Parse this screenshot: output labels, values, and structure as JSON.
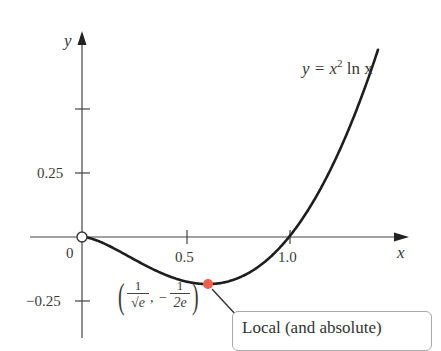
{
  "chart_data": {
    "type": "line",
    "title": "",
    "function_label": "y = x² ln x",
    "xlabel": "x",
    "ylabel": "y",
    "x_ticks": [
      {
        "value": 0,
        "label": "0"
      },
      {
        "value": 0.5,
        "label": "0.5"
      },
      {
        "value": 1.0,
        "label": "1.0"
      }
    ],
    "y_ticks": [
      {
        "value": 0.5,
        "label": ""
      },
      {
        "value": 0.25,
        "label": "0.25"
      },
      {
        "value": -0.25,
        "label": "−0.25"
      }
    ],
    "xlim": [
      -0.25,
      1.55
    ],
    "ylim": [
      -0.35,
      0.8
    ],
    "grid": false,
    "series": [
      {
        "name": "y = x^2 ln x",
        "x": [
          0,
          0.1,
          0.2,
          0.3,
          0.4,
          0.5,
          0.6065,
          0.7,
          0.8,
          0.9,
          1.0,
          1.1,
          1.2,
          1.3,
          1.4,
          1.43
        ],
        "y": [
          0,
          -0.023,
          -0.064,
          -0.108,
          -0.147,
          -0.173,
          -0.184,
          -0.175,
          -0.143,
          -0.085,
          0,
          0.115,
          0.263,
          0.443,
          0.659,
          0.731
        ]
      }
    ],
    "annotations": [
      {
        "type": "open_point",
        "x": 0,
        "y": 0,
        "note": "hole at origin (function undefined at x=0)"
      },
      {
        "type": "point",
        "x": 0.6065,
        "y": -0.1839,
        "color": "#f0604f",
        "label": "(1/√e, −1/(2e))"
      },
      {
        "type": "callout",
        "text": "Local (and absolute)",
        "points_to": [
          0.6065,
          -0.1839
        ]
      }
    ]
  },
  "labels": {
    "function": "y = x",
    "exponent": "2",
    "function_tail": " ln x",
    "x_axis": "x",
    "y_axis": "y",
    "origin": "0",
    "x_tick_05": "0.5",
    "x_tick_10": "1.0",
    "y_tick_025": "0.25",
    "y_tick_m025": "−0.25",
    "point_num1": "1",
    "point_den1": "√e",
    "point_num2": "1",
    "point_den2": "2e",
    "callout": "Local (and absolute)"
  },
  "colors": {
    "curve": "#1e1e1e",
    "axes": "#444444",
    "point": "#f0604f"
  }
}
